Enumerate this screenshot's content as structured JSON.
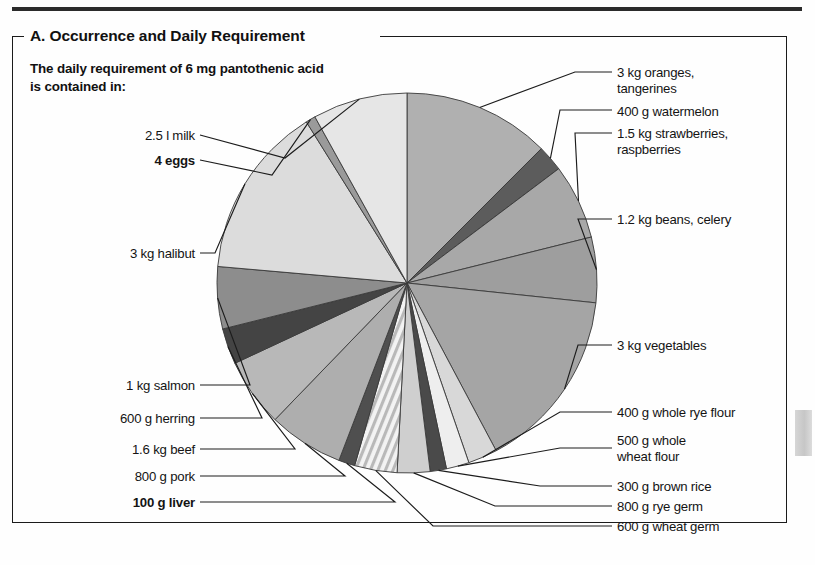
{
  "panel": {
    "title": "A. Occurrence and Daily Requirement",
    "caption": "The daily requirement of 6 mg\npantothenic acid is contained in:"
  },
  "colors": {
    "ink": "#141414",
    "frame": "#1b1b1b",
    "rule": "#2b2b2b",
    "edge_tab": "#cfcfcf",
    "slice_outline": "#3a3a3a"
  },
  "chart_data": {
    "type": "pie",
    "title": "A. Occurrence and Daily Requirement",
    "subtitle": "The daily requirement of 6 mg pantothenic acid is contained in:",
    "units": "degrees of a 360° circle",
    "legend": "labels placed around pie with leader lines",
    "center": [
      407,
      283
    ],
    "radius": 190,
    "start_angle_deg": 0,
    "direction": "clockwise",
    "slices": [
      {
        "label": "3 kg oranges, tangerines",
        "label_text": "3 kg oranges,\ntangerines",
        "start": 0,
        "end": 45,
        "value": 45,
        "fill": "#b0b0b0",
        "bold": false
      },
      {
        "label": "400 g watermelon",
        "label_text": "400 g watermelon",
        "start": 45,
        "end": 53,
        "value": 8,
        "fill": "#5c5c5c",
        "bold": false
      },
      {
        "label": "1.5 kg strawberries, raspberries",
        "label_text": "1.5 kg strawberries,\nraspberries",
        "start": 53,
        "end": 76,
        "value": 23,
        "fill": "#a8a8a8",
        "bold": false
      },
      {
        "label": "1.2 kg beans, celery",
        "label_text": "1.2 kg beans, celery",
        "start": 76,
        "end": 96,
        "value": 20,
        "fill": "#9e9e9e",
        "bold": false
      },
      {
        "label": "3 kg vegetables",
        "label_text": "3 kg vegetables",
        "start": 96,
        "end": 152,
        "value": 56,
        "fill": "#a5a5a5",
        "bold": false
      },
      {
        "label": "400 g whole rye flour",
        "label_text": "400 g whole rye flour",
        "start": 152,
        "end": 161,
        "value": 9,
        "fill": "#d8d8d8",
        "bold": false
      },
      {
        "label": "500 g whole wheat flour",
        "label_text": "500 g whole\nwheat flour",
        "start": 161,
        "end": 168,
        "value": 7,
        "fill": "#eeeeee",
        "bold": false
      },
      {
        "label": "300 g brown rice",
        "label_text": "300 g brown rice",
        "start": 168,
        "end": 173,
        "value": 5,
        "fill": "#4a4a4a",
        "bold": false
      },
      {
        "label": "800 g rye germ",
        "label_text": "800 g rye germ",
        "start": 173,
        "end": 183,
        "value": 10,
        "fill": "#cfcfcf",
        "bold": false
      },
      {
        "label": "600 g wheat germ",
        "label_text": "600 g wheat germ",
        "start": 183,
        "end": 196,
        "value": 13,
        "fill": "hatch",
        "bold": false
      },
      {
        "label": "100 g liver",
        "label_text": "100 g liver",
        "start": 196,
        "end": 201,
        "value": 5,
        "fill": "#4f4f4f",
        "bold": true
      },
      {
        "label": "800 g pork",
        "label_text": "800 g pork",
        "start": 201,
        "end": 224,
        "value": 23,
        "fill": "#aeaeae",
        "bold": false
      },
      {
        "label": "1.6 kg beef",
        "label_text": "1.6 kg beef",
        "start": 224,
        "end": 245,
        "value": 21,
        "fill": "#b8b8b8",
        "bold": false
      },
      {
        "label": "600 g herring",
        "label_text": "600 g herring",
        "start": 245,
        "end": 256,
        "value": 11,
        "fill": "#444444",
        "bold": false
      },
      {
        "label": "1 kg salmon",
        "label_text": "1 kg salmon",
        "start": 256,
        "end": 275,
        "value": 19,
        "fill": "#8d8d8d",
        "bold": false
      },
      {
        "label": "3 kg halibut",
        "label_text": "3 kg halibut",
        "start": 275,
        "end": 328,
        "value": 53,
        "fill": "#dcdcdc",
        "bold": false
      },
      {
        "label": "4 eggs",
        "label_text": "4 eggs",
        "start": 328,
        "end": 331,
        "value": 3,
        "fill": "#9a9a9a",
        "bold": true
      },
      {
        "label": "2.5 l milk",
        "label_text": "2.5 l milk",
        "start": 331,
        "end": 360,
        "value": 29,
        "fill": "#e6e6e6",
        "bold": false
      }
    ]
  },
  "labels_right": [
    {
      "name": "oranges",
      "text": "3 kg oranges,\ntangerines"
    },
    {
      "name": "watermelon",
      "text": "400 g watermelon"
    },
    {
      "name": "strawberries",
      "text": "1.5 kg strawberries,\nraspberries"
    },
    {
      "name": "beans",
      "text": "1.2 kg beans, celery"
    },
    {
      "name": "vegetables",
      "text": "3 kg vegetables"
    },
    {
      "name": "rye-flour",
      "text": "400 g whole rye flour"
    },
    {
      "name": "wheat-flour",
      "text": "500 g whole\nwheat flour"
    },
    {
      "name": "brown-rice",
      "text": "300 g brown rice"
    },
    {
      "name": "rye-germ",
      "text": "800 g rye germ"
    },
    {
      "name": "wheat-germ",
      "text": "600 g wheat germ"
    }
  ],
  "labels_left": [
    {
      "name": "milk",
      "text": "2.5 l milk",
      "bold": false
    },
    {
      "name": "eggs",
      "text": "4 eggs",
      "bold": true
    },
    {
      "name": "halibut",
      "text": "3 kg halibut",
      "bold": false
    },
    {
      "name": "salmon",
      "text": "1 kg salmon",
      "bold": false
    },
    {
      "name": "herring",
      "text": "600 g herring",
      "bold": false
    },
    {
      "name": "beef",
      "text": "1.6 kg beef",
      "bold": false
    },
    {
      "name": "pork",
      "text": "800 g pork",
      "bold": false
    },
    {
      "name": "liver",
      "text": "100 g liver",
      "bold": true
    }
  ]
}
